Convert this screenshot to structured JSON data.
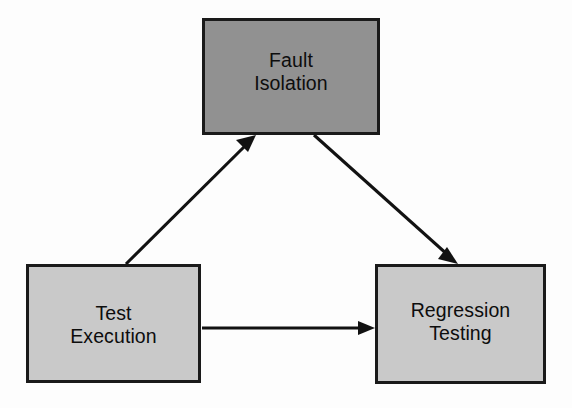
{
  "diagram": {
    "background_color": "#fdfdfd",
    "nodes": [
      {
        "id": "fault-isolation",
        "label_line1": "Fault",
        "label_line2": "Isolation",
        "fill_color": "#919191",
        "border_color": "#1a1a1a",
        "text_color": "#0d0d0d"
      },
      {
        "id": "test-execution",
        "label_line1": "Test",
        "label_line2": "Execution",
        "fill_color": "#c9c9c9",
        "border_color": "#1a1a1a",
        "text_color": "#0d0d0d"
      },
      {
        "id": "regression-testing",
        "label_line1": "Regression",
        "label_line2": "Testing",
        "fill_color": "#c9c9c9",
        "border_color": "#1a1a1a",
        "text_color": "#0d0d0d"
      }
    ],
    "edges": [
      {
        "id": "test-execution-to-fault-isolation",
        "from": "test-execution",
        "to": "fault-isolation",
        "label": "",
        "color": "#121212"
      },
      {
        "id": "fault-isolation-to-regression-testing",
        "from": "fault-isolation",
        "to": "regression-testing",
        "label": "",
        "color": "#121212"
      },
      {
        "id": "test-execution-to-regression-testing",
        "from": "test-execution",
        "to": "regression-testing",
        "label": "",
        "color": "#121212"
      }
    ]
  }
}
